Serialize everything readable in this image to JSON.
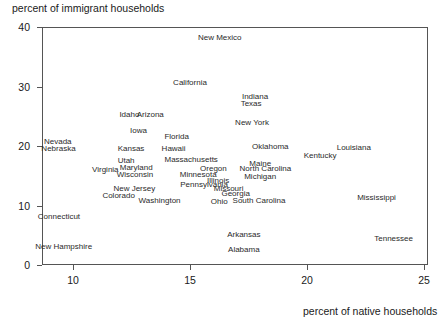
{
  "chart_data": {
    "type": "scatter",
    "title": "percent of immigrant households",
    "xlabel": "percent of native households",
    "ylabel": "percent of immigrant households",
    "xlim": [
      8.675,
      25.17
    ],
    "ylim": [
      0,
      40
    ],
    "xticks": [
      10,
      15,
      20,
      25
    ],
    "xtick_labels": [
      "10",
      "15",
      "20",
      "25"
    ],
    "yticks": [
      0,
      10,
      20,
      30,
      40
    ],
    "ytick_labels": [
      "0",
      "10",
      "20",
      "30",
      "40"
    ],
    "grid": false,
    "legend": null,
    "marker_style": "text-label-only",
    "points": [
      {
        "label": "New Mexico",
        "x": 16.27,
        "y": 38.15
      },
      {
        "label": "California",
        "x": 15.0,
        "y": 30.6
      },
      {
        "label": "Indiana",
        "x": 17.78,
        "y": 28.25
      },
      {
        "label": "Texas",
        "x": 17.61,
        "y": 27.1
      },
      {
        "label": "Idaho",
        "x": 12.41,
        "y": 25.25
      },
      {
        "label": "Arizona",
        "x": 13.3,
        "y": 25.25
      },
      {
        "label": "New York",
        "x": 17.65,
        "y": 23.9
      },
      {
        "label": "Iowa",
        "x": 12.8,
        "y": 22.6
      },
      {
        "label": "Florida",
        "x": 14.43,
        "y": 21.45
      },
      {
        "label": "Nevada",
        "x": 9.35,
        "y": 20.7
      },
      {
        "label": "Louisiana",
        "x": 22.0,
        "y": 19.7
      },
      {
        "label": "Nebraska",
        "x": 9.38,
        "y": 19.55
      },
      {
        "label": "Kansas",
        "x": 12.48,
        "y": 19.55
      },
      {
        "label": "Hawaii",
        "x": 14.3,
        "y": 19.55
      },
      {
        "label": "Oklahoma",
        "x": 18.43,
        "y": 19.75
      },
      {
        "label": "Kentucky",
        "x": 20.56,
        "y": 18.4
      },
      {
        "label": "Utah",
        "x": 12.27,
        "y": 17.5
      },
      {
        "label": "Massachusetts",
        "x": 15.05,
        "y": 17.6
      },
      {
        "label": "Maine",
        "x": 18.0,
        "y": 17.0
      },
      {
        "label": "Virginia",
        "x": 11.38,
        "y": 15.9
      },
      {
        "label": "Maryland",
        "x": 12.7,
        "y": 16.3
      },
      {
        "label": "Oregon",
        "x": 16.0,
        "y": 16.1
      },
      {
        "label": "North Carolina",
        "x": 18.22,
        "y": 16.1
      },
      {
        "label": "Wisconsin",
        "x": 12.65,
        "y": 15.1
      },
      {
        "label": "Minnesota",
        "x": 15.35,
        "y": 15.2
      },
      {
        "label": "Michigan",
        "x": 18.0,
        "y": 14.8
      },
      {
        "label": "Illinois",
        "x": 16.2,
        "y": 14.2
      },
      {
        "label": "Pennsylvania",
        "x": 15.6,
        "y": 13.5
      },
      {
        "label": "Missouri",
        "x": 16.65,
        "y": 12.85
      },
      {
        "label": "New Jersey",
        "x": 12.62,
        "y": 12.7
      },
      {
        "label": "Georgia",
        "x": 16.95,
        "y": 12.0
      },
      {
        "label": "Colorado",
        "x": 11.95,
        "y": 11.55
      },
      {
        "label": "Mississippi",
        "x": 22.97,
        "y": 11.3
      },
      {
        "label": "Washington",
        "x": 13.7,
        "y": 10.7
      },
      {
        "label": "Ohio",
        "x": 16.25,
        "y": 10.55
      },
      {
        "label": "South Carolina",
        "x": 17.95,
        "y": 10.7
      },
      {
        "label": "Connecticut",
        "x": 9.4,
        "y": 8.0
      },
      {
        "label": "Arkansas",
        "x": 17.3,
        "y": 5.1
      },
      {
        "label": "Tennessee",
        "x": 23.7,
        "y": 4.35
      },
      {
        "label": "Alabama",
        "x": 17.3,
        "y": 2.6
      },
      {
        "label": "New Hampshire",
        "x": 9.6,
        "y": 3.1
      }
    ]
  },
  "colors": {
    "axis": "#555555",
    "text": "#1a1a1a",
    "label": "#2a2a2a",
    "background": "#ffffff"
  }
}
